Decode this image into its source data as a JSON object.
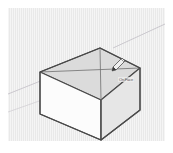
{
  "app": {
    "name": "3D Modeling Viewport",
    "title": "SketchUp-style box model"
  },
  "viewport": {
    "background_color": "#e9e9e9",
    "paper_margin_color": "#ffffff",
    "edge_color": "#4a4a4a",
    "guide_color": "#8c8c8c",
    "axis_color": "#c2bfc6",
    "face_top_color": "#dcdcdc",
    "face_front_color": "#fbfbfb",
    "face_right_color": "#e2e2e2",
    "shadow_color": "#d8d8d8"
  },
  "model": {
    "name": "box",
    "label": "Rectangular Box",
    "top_face_label": "Top Face",
    "front_face_label": "Front Face",
    "right_face_label": "Right Face",
    "diagonal_guides_label": "Diagonal construction lines",
    "vertices": {
      "top_back": "92,40",
      "top_left": "32,64",
      "top_front": "93,92",
      "top_right": "132,60",
      "bottom_left": "32,106",
      "bottom_front": "93,132",
      "bottom_right": "132,102"
    }
  },
  "axes": {
    "red_axis_label": "Red axis",
    "green_axis_label": "Green axis",
    "ground_plane_label": "Ground plane"
  },
  "cursor": {
    "tool": "pencil-tool",
    "tool_label": "Line / Pencil tool",
    "tooltip_text": "On Face",
    "x": 104,
    "y": 58
  }
}
